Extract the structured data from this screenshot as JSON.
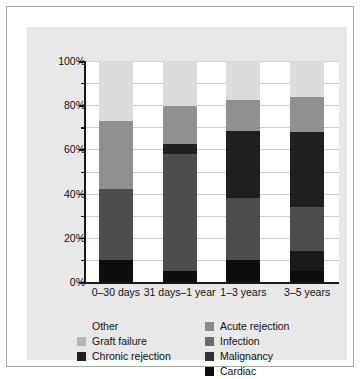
{
  "chart_data": {
    "type": "bar",
    "stacked": true,
    "title": "",
    "xlabel": "",
    "ylabel": "",
    "ylim": [
      0,
      100
    ],
    "ytick_labels": [
      "0%",
      "20%",
      "40%",
      "60%",
      "80%",
      "100%"
    ],
    "ytick_values": [
      0,
      20,
      40,
      60,
      80,
      100
    ],
    "yminor_values": [
      10,
      30,
      50,
      70,
      90
    ],
    "grid": true,
    "legend_position": "bottom",
    "categories": [
      "0–30 days",
      "31 days–1 year",
      "1–3 years",
      "3–5 years"
    ],
    "series": [
      {
        "name": "Cardiac",
        "color": "#0d0d0d",
        "values": [
          10.0,
          5.0,
          10.0,
          5.0
        ]
      },
      {
        "name": "Malignancy",
        "color": "#1a1a1a",
        "values": [
          0.0,
          0.0,
          0.0,
          9.0
        ]
      },
      {
        "name": "Infection",
        "color": "#4d4d4d",
        "values": [
          32.0,
          53.0,
          28.0,
          20.0
        ]
      },
      {
        "name": "Acute rejection",
        "color": "#8a8a8a",
        "values": [
          0.0,
          0.0,
          0.0,
          0.0
        ]
      },
      {
        "name": "Chronic rejection",
        "color": "#1f1f1f",
        "values": [
          0.0,
          4.5,
          30.5,
          34.0
        ]
      },
      {
        "name": "Graft failure",
        "color": "#909090",
        "values": [
          31.0,
          17.0,
          14.0,
          15.5
        ]
      },
      {
        "name": "Other",
        "color": "#dcdcdc",
        "values": [
          27.0,
          20.5,
          17.5,
          16.5
        ]
      }
    ],
    "bar_tops_percent": [
      73.0,
      79.5,
      82.5,
      83.5
    ]
  },
  "legend": {
    "columns": [
      {
        "name": "left-column",
        "items": [
          {
            "label": "Other",
            "swatch": "none",
            "color": "#dcdcdc"
          },
          {
            "label": "Graft failure",
            "swatch": "filled",
            "color": "#b4b4b4"
          },
          {
            "label": "Chronic rejection",
            "swatch": "filled",
            "color": "#1f1f1f"
          }
        ]
      },
      {
        "name": "right-column",
        "items": [
          {
            "label": "Acute rejection",
            "swatch": "filled",
            "color": "#8a8a8a"
          },
          {
            "label": "Infection",
            "swatch": "filled",
            "color": "#6b6b6b"
          },
          {
            "label": "Malignancy",
            "swatch": "filled",
            "color": "#333333"
          },
          {
            "label": "Cardiac",
            "swatch": "filled",
            "color": "#0d0d0d"
          }
        ]
      }
    ]
  },
  "colors": {
    "panel_background": "#e8e8e8",
    "plot_background": "#ffffff",
    "grid": "#cfcfcf",
    "axis": "#1a1a1a",
    "frame": "#a8a8a8",
    "text": "#111111"
  }
}
